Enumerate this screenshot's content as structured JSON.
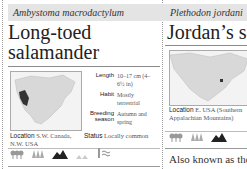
{
  "cards": [
    {
      "latin_name": "Ambystoma macrodactylum",
      "common_name_line1": "Long-toed",
      "common_name_line2": "salamander",
      "facts": [
        {
          "label": "Length",
          "value": "10–17 cm (4–6½ in)"
        },
        {
          "label": "Habit",
          "value": "Mostly terrestrial"
        },
        {
          "label": "Breeding season",
          "label_line1": "Breeding",
          "label_line2": "season",
          "value": "Autumn and spring"
        }
      ],
      "location_label": "Location",
      "location_value": "S.W. Canada, N.W. USA",
      "status_label": "Status",
      "status_value": "Locally common",
      "habitat_icons": [
        "deciduous-forest-icon",
        "coniferous-forest-icon",
        "mountain-icon",
        "grassland-icon",
        "freshwater-icon"
      ]
    },
    {
      "latin_name": "Plethodon jordani",
      "common_name": "Jordan’s sa",
      "location_label": "Location",
      "location_value": "E. USA (Southern Appalachian Mountains)",
      "habitat_icons": [
        "deciduous-forest-icon",
        "coniferous-forest-icon",
        "mountain-icon"
      ],
      "body_text": "Also known as the"
    }
  ],
  "colors": {
    "header_band": "#e4e4e4",
    "range_highlight": "#333333"
  }
}
